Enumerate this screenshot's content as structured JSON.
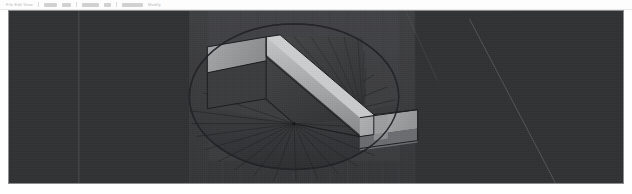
{
  "app": {
    "title": "3D Modeling Viewport",
    "background_color": "#ffffff"
  },
  "toolbar": {
    "name": "top-toolbar",
    "clipped": true,
    "label_left": "File  Edit  View",
    "label_right": "Modify",
    "items": [
      {
        "name": "toolbar-icon-1",
        "glyph": ""
      },
      {
        "name": "toolbar-icon-2",
        "glyph": ""
      },
      {
        "name": "toolbar-icon-3",
        "glyph": ""
      },
      {
        "name": "toolbar-icon-4",
        "glyph": ""
      },
      {
        "name": "toolbar-icon-5",
        "glyph": ""
      }
    ]
  },
  "viewport": {
    "name": "3d-viewport",
    "background_color": "#313234",
    "border_color": "#8e8e8e",
    "x": 8,
    "y": 10,
    "width": 616,
    "height": 174,
    "shading_mode": "shaded",
    "model": {
      "name": "helical-stair-in-cylindrical-shaft",
      "center_x": 294,
      "center_y": 123,
      "ellipse_cx": 294,
      "ellipse_cy": 75,
      "ellipse_rx": 105,
      "ellipse_ry": 72,
      "radial_spokes": 22,
      "wall_grid_lines": 14,
      "colors": {
        "shaft_wall_far": "#47484a",
        "shaft_wall_near": "#3c3d3f",
        "floor_dark": "#333436",
        "tread_top_light": "#a9aaac",
        "riser_face_mid": "#8c8d8f",
        "stringer_light": "#c3c4c6",
        "soffit_dark": "#3e3f41",
        "edge_line": "#1b1c1e",
        "construction_line": "#6a6b6d",
        "grid_line": "#3f4042"
      }
    },
    "annotations": {
      "floor_vertical_guide_x": 78,
      "diagonal_construction_line": "from (470,18) to (556,180)"
    }
  }
}
